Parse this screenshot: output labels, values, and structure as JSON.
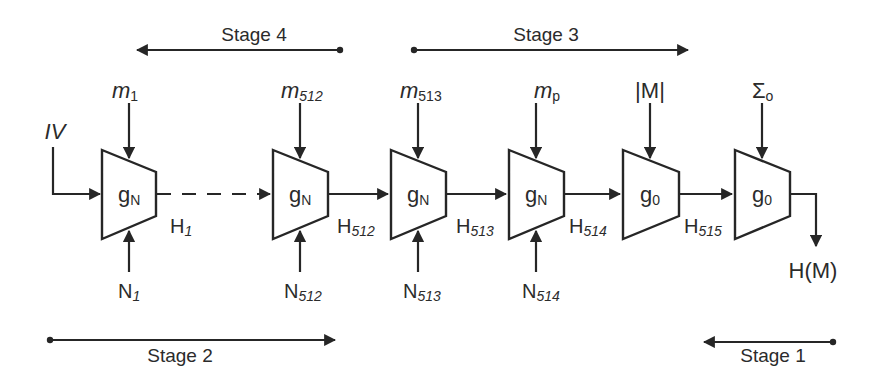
{
  "diagram": {
    "type": "hash-construction-pipeline",
    "stages": [
      {
        "label": "Stage 4",
        "direction": "left",
        "position": "top"
      },
      {
        "label": "Stage 3",
        "direction": "right",
        "position": "top"
      },
      {
        "label": "Stage 2",
        "direction": "right",
        "position": "bottom"
      },
      {
        "label": "Stage 1",
        "direction": "left",
        "position": "bottom"
      }
    ],
    "initial_input": {
      "label": "IV"
    },
    "blocks": [
      {
        "fn": "g",
        "fn_sub": "N",
        "top_input": {
          "base": "m",
          "sub": "1"
        },
        "bottom_input": {
          "base": "N",
          "sub": "1"
        },
        "output": {
          "base": "H",
          "sub": "1"
        },
        "output_style": "dashed"
      },
      {
        "fn": "g",
        "fn_sub": "N",
        "top_input": {
          "base": "m",
          "sub": "512"
        },
        "bottom_input": {
          "base": "N",
          "sub": "512"
        },
        "output": {
          "base": "H",
          "sub": "512"
        },
        "output_style": "solid"
      },
      {
        "fn": "g",
        "fn_sub": "N",
        "top_input": {
          "base": "m",
          "sub": "513"
        },
        "bottom_input": {
          "base": "N",
          "sub": "513"
        },
        "output": {
          "base": "H",
          "sub": "513"
        },
        "output_style": "solid"
      },
      {
        "fn": "g",
        "fn_sub": "N",
        "top_input": {
          "base": "m",
          "sub": "p"
        },
        "bottom_input": {
          "base": "N",
          "sub": "514"
        },
        "output": {
          "base": "H",
          "sub": "514"
        },
        "output_style": "solid"
      },
      {
        "fn": "g",
        "fn_sub": "0",
        "top_input": {
          "base": "|M|",
          "sub": ""
        },
        "bottom_input": null,
        "output": {
          "base": "H",
          "sub": "515"
        },
        "output_style": "solid"
      },
      {
        "fn": "g",
        "fn_sub": "0",
        "top_input": {
          "base": "Σ",
          "sub": "o"
        },
        "bottom_input": null,
        "output": null,
        "output_style": "solid"
      }
    ],
    "final_output": {
      "label": "H(M)"
    }
  }
}
